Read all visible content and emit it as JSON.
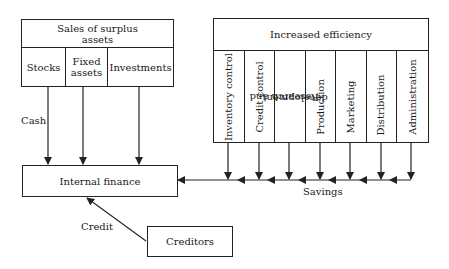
{
  "diagram": {
    "sales_box": {
      "title": "Sales of surplus assets",
      "title_line1": "Sales of surplus",
      "title_line2": "assets",
      "items": [
        {
          "label": "Stocks"
        },
        {
          "label_line1": "Fixed",
          "label_line2": "assets",
          "label": "Fixed assets"
        },
        {
          "label": "Investments"
        }
      ]
    },
    "efficiency_box": {
      "title": "Increased efficiency",
      "items": [
        {
          "label": "Inventory control"
        },
        {
          "label": "Credit control"
        },
        {
          "label_line1": "Research and",
          "label_line2": "development",
          "label": "Research and development"
        },
        {
          "label": "Production"
        },
        {
          "label": "Marketing"
        },
        {
          "label": "Distribution"
        },
        {
          "label": "Administration"
        }
      ]
    },
    "internal_finance": {
      "label": "Internal finance"
    },
    "creditors": {
      "label": "Creditors"
    },
    "edge_labels": {
      "cash": "Cash",
      "savings": "Savings",
      "credit": "Credit"
    },
    "colors": {
      "line": "#222222",
      "background": "#ffffff"
    }
  }
}
